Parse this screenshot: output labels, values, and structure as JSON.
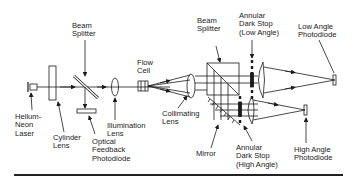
{
  "diagram": {
    "type": "optical-schematic",
    "labels": {
      "laser": "Helium-\nNeon\nLaser",
      "cylinder_lens": "Cylinder\nLens",
      "beam_splitter_1": "Beam\nSplitter",
      "optical_feedback": "Optical\nFeedback\nPhotodiode",
      "illumination_lens": "Illumination\nLens",
      "flow_cell": "Flow\nCell",
      "collimating_lens": "Collimating\nLens",
      "beam_splitter_2": "Beam\nSplitter",
      "mirror": "Mirror",
      "dark_stop_low": "Annular\nDark Stop\n(Low Angle)",
      "dark_stop_high": "Annular\nDark Stop\n(High Angle)",
      "low_angle_pd": "Low Angle\nPhotodiode",
      "high_angle_pd": "High Angle\nPhotodiode"
    },
    "colors": {
      "ink": "#1a1a1a",
      "background": "#ffffff"
    }
  }
}
